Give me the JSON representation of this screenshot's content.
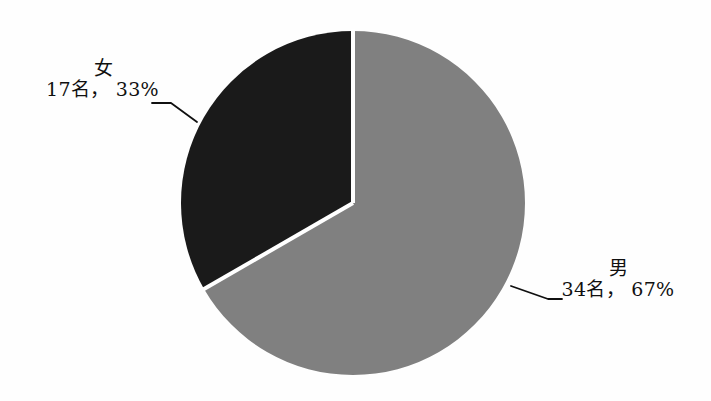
{
  "chart_data": {
    "type": "pie",
    "title": "",
    "categories": [
      "男",
      "女"
    ],
    "values": [
      34,
      17
    ],
    "percentages": [
      67,
      33
    ],
    "labels": [
      {
        "name": "男",
        "value_text": "34名， 67%",
        "count": 34,
        "count_unit": "名",
        "percent": 67,
        "color": "#808080",
        "start_angle_deg": 0,
        "sweep_deg": 241.2,
        "leader": true,
        "position": "right"
      },
      {
        "name": "女",
        "value_text": "17名， 33%",
        "count": 17,
        "count_unit": "名",
        "percent": 33,
        "color": "#1a1a1a",
        "start_angle_deg": 241.2,
        "sweep_deg": 118.8,
        "leader": true,
        "position": "left"
      }
    ],
    "total": 51,
    "legend": "none",
    "grid": false,
    "start_angle_note": "first slice begins at 12 o'clock, drawn clockwise",
    "geometry": {
      "center_x": 353,
      "center_y": 203,
      "radius": 172
    },
    "colors": {
      "slice_male": "#808080",
      "slice_female": "#1a1a1a",
      "separator": "#ffffff",
      "background": "#fefefe",
      "leader_line": "#101010",
      "text": "#101010"
    }
  },
  "canvas": {
    "width": 711,
    "height": 401
  }
}
